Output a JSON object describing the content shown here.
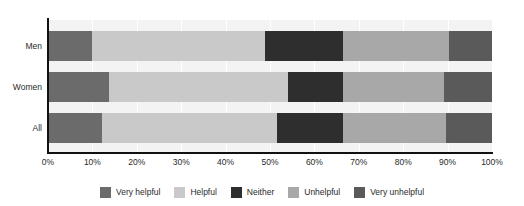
{
  "title": "",
  "chart_data": {
    "type": "bar",
    "orientation": "horizontal",
    "stacked": true,
    "stack_mode": "percent",
    "title": "",
    "subtitle": "",
    "xlabel": "",
    "ylabel": "",
    "xlim": [
      0,
      100
    ],
    "grid": true,
    "legend_position": "bottom",
    "categories": [
      "Men",
      "Women",
      "All"
    ],
    "xticks": [
      0,
      10,
      20,
      30,
      40,
      50,
      60,
      70,
      80,
      90,
      100
    ],
    "xticklabels": [
      "0%",
      "10%",
      "20%",
      "30%",
      "40%",
      "50%",
      "60%",
      "70%",
      "80%",
      "90%",
      "100%"
    ],
    "series": [
      {
        "name": "Very helpful",
        "color": "#6b6b6b",
        "values": [
          9.8,
          13.7,
          12.2
        ]
      },
      {
        "name": "Helpful",
        "color": "#c9c9c9",
        "values": [
          39.1,
          40.3,
          39.4
        ]
      },
      {
        "name": "Neither",
        "color": "#2e2e2e",
        "values": [
          17.5,
          12.4,
          14.8
        ]
      },
      {
        "name": "Unhelpful",
        "color": "#a8a8a8",
        "values": [
          23.9,
          22.8,
          23.2
        ]
      },
      {
        "name": "Very unhelpful",
        "color": "#5a5a5a",
        "values": [
          9.7,
          10.8,
          10.4
        ]
      }
    ]
  },
  "legend": {
    "items": [
      {
        "label": "Very helpful",
        "color": "#6b6b6b"
      },
      {
        "label": "Helpful",
        "color": "#c9c9c9"
      },
      {
        "label": "Neither",
        "color": "#2e2e2e"
      },
      {
        "label": "Unhelpful",
        "color": "#a8a8a8"
      },
      {
        "label": "Very unhelpful",
        "color": "#5a5a5a"
      }
    ]
  },
  "colors": {
    "plot_background": "#f3f3f3",
    "page_background": "#ffffff",
    "axis": "#111111",
    "gridline": "#ffffff",
    "text": "#2a2a2a"
  }
}
